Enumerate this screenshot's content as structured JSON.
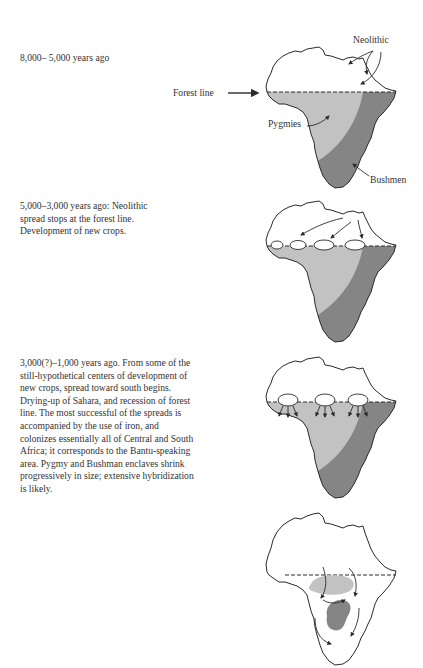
{
  "stages": [
    {
      "id": "stage-1",
      "caption_lines": [
        "8,000– 5,000 years ago"
      ],
      "labels": {
        "neolithic": "Neolithic",
        "forest_line": "Forest line",
        "pygmies": "Pygmies",
        "bushmen": "Bushmen"
      }
    },
    {
      "id": "stage-2",
      "caption_lines": [
        "5,000–3,000 years ago:  Neolithic",
        "spread stops at the forest line.",
        "Development of new crops."
      ]
    },
    {
      "id": "stage-3",
      "caption_lines": [
        "3,000(?)–1,000 years ago. From some of the",
        "still-hypothetical centers of development of",
        "new crops, spread toward south begins.",
        "Drying-up of Sahara, and recession of forest",
        "line. The most successful of the spreads is",
        "accompanied by the use of iron, and",
        "colonizes essentially all of Central and South",
        "Africa; it corresponds to the Bantu-speaking",
        "area. Pygmy and Bushman enclaves shrink",
        "progressively in size; extensive hybridization",
        "is likely."
      ]
    },
    {
      "id": "stage-4",
      "caption_lines": []
    }
  ],
  "colors": {
    "outline": "#2a2a2a",
    "pygmy_region": "#c2c2c2",
    "bushmen_region": "#858585",
    "background": "#ffffff"
  }
}
